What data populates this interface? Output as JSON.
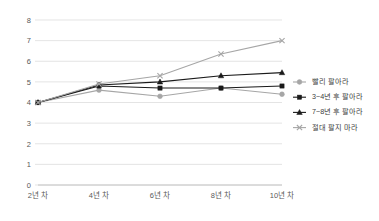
{
  "chart_data": {
    "type": "line",
    "title": "",
    "xlabel": "",
    "ylabel": "",
    "ylim": [
      0,
      8
    ],
    "ytick_step": 1,
    "yticks": [
      "0",
      "1",
      "2",
      "3",
      "4",
      "5",
      "6",
      "7",
      "8"
    ],
    "grid": true,
    "legend_position": "right",
    "categories": [
      "2년 차",
      "4년 차",
      "6년 차",
      "8년 차",
      "10년 차"
    ],
    "series": [
      {
        "name": "빨리 팔아라",
        "values": [
          4.0,
          4.6,
          4.3,
          4.7,
          4.4
        ],
        "color": "#a6a6a6",
        "marker": "circle"
      },
      {
        "name": "3~4년 후 팔아라",
        "values": [
          4.0,
          4.8,
          4.7,
          4.7,
          4.8
        ],
        "color": "#1a1a1a",
        "marker": "square"
      },
      {
        "name": "7~8년 후 팔아라",
        "values": [
          4.0,
          4.85,
          5.0,
          5.3,
          5.45
        ],
        "color": "#1a1a1a",
        "marker": "triangle"
      },
      {
        "name": "절대 팔지 마라",
        "values": [
          4.0,
          4.9,
          5.3,
          6.35,
          7.0
        ],
        "color": "#a6a6a6",
        "marker": "x"
      }
    ]
  },
  "colors": {
    "grid": "#d9d9d9",
    "axis": "#a6a6a6",
    "tick_text": "#595959",
    "legend_text": "#404040",
    "background": "#ffffff"
  }
}
